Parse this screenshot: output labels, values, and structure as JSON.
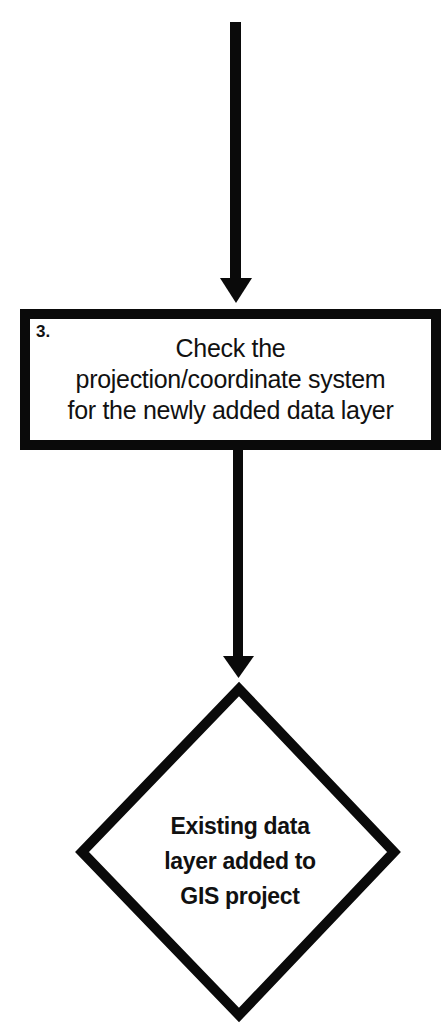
{
  "flowchart": {
    "process_step": {
      "number": "3.",
      "lines": [
        "Check the",
        "projection/coordinate system",
        "for the newly added data layer"
      ]
    },
    "decision": {
      "lines": [
        "Existing data",
        "layer added to",
        "GIS project"
      ]
    },
    "connectors": [
      {
        "from": "top-edge",
        "to": "process-step-3",
        "direction": "down"
      },
      {
        "from": "process-step-3",
        "to": "decision",
        "direction": "down"
      }
    ],
    "colors": {
      "stroke": "#0a0a0a",
      "fill": "#ffffff",
      "text": "#111111"
    }
  }
}
